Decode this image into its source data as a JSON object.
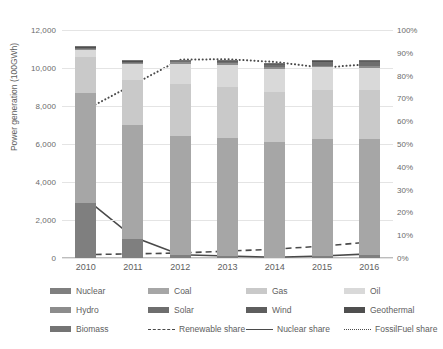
{
  "chart_data": {
    "type": "bar",
    "title": "",
    "subtitle": "",
    "xlabel": "",
    "ylabel": "Power generation (100GWh)",
    "y2label": "",
    "categories": [
      "2010",
      "2011",
      "2012",
      "2013",
      "2014",
      "2015",
      "2016"
    ],
    "ylim": [
      0,
      12000
    ],
    "y2lim": [
      0,
      100
    ],
    "yticks": [
      "0",
      "2,000",
      "4,000",
      "6,000",
      "8,000",
      "10,000",
      "12,000"
    ],
    "ytick_values": [
      0,
      2000,
      4000,
      6000,
      8000,
      10000,
      12000
    ],
    "y2ticks": [
      "0%",
      "10%",
      "20%",
      "30%",
      "40%",
      "50%",
      "60%",
      "70%",
      "80%",
      "90%",
      "100%"
    ],
    "y2tick_values": [
      0,
      10,
      20,
      30,
      40,
      50,
      60,
      70,
      80,
      90,
      100
    ],
    "grid": true,
    "legend_position": "bottom",
    "stacked": true,
    "series": [
      {
        "name": "Nuclear",
        "axis": "left",
        "kind": "bar",
        "color": "#7f7f7f",
        "values": [
          2882,
          1018,
          159,
          93,
          0,
          94,
          181
        ]
      },
      {
        "name": "Coal",
        "axis": "left",
        "kind": "bar",
        "color": "#a6a6a6",
        "values": [
          5800,
          5987,
          6240,
          6206,
          6100,
          6144,
          6094
        ]
      },
      {
        "name": "Gas",
        "axis": "left",
        "kind": "bar",
        "color": "#c9c9c9",
        "values": [
          1880,
          2386,
          2770,
          2700,
          2660,
          2620,
          2580
        ]
      },
      {
        "name": "Oil",
        "axis": "left",
        "kind": "bar",
        "color": "#d9d9d9",
        "values": [
          410,
          820,
          1060,
          1180,
          1200,
          1180,
          1140
        ]
      },
      {
        "name": "Hydro",
        "axis": "left",
        "kind": "bar",
        "color": "#8c8c8c",
        "values": [
          85,
          90,
          92,
          88,
          90,
          92,
          95
        ]
      },
      {
        "name": "Solar",
        "axis": "left",
        "kind": "bar",
        "color": "#6e6e6e",
        "values": [
          5,
          12,
          30,
          70,
          120,
          180,
          240
        ]
      },
      {
        "name": "Wind",
        "axis": "left",
        "kind": "bar",
        "color": "#5e5e5e",
        "values": [
          40,
          45,
          48,
          52,
          56,
          60,
          64
        ]
      },
      {
        "name": "Geothermal",
        "axis": "left",
        "kind": "bar",
        "color": "#4f4f4f",
        "values": [
          26,
          27,
          26,
          26,
          26,
          26,
          26
        ]
      },
      {
        "name": "Biomass",
        "axis": "left",
        "kind": "bar",
        "color": "#747474",
        "values": [
          12,
          15,
          18,
          20,
          22,
          24,
          26
        ]
      },
      {
        "name": "Renewable share",
        "axis": "right",
        "kind": "line",
        "style": "dashed",
        "color": "#4a4a4a",
        "values": [
          1.5,
          1.8,
          2.2,
          3.0,
          3.9,
          5.2,
          7.0
        ]
      },
      {
        "name": "Nuclear share",
        "axis": "right",
        "kind": "line",
        "style": "solid",
        "color": "#4a4a4a",
        "values": [
          26.0,
          9.3,
          1.4,
          0.9,
          0.3,
          0.9,
          1.8
        ]
      },
      {
        "name": "FossilFuel share",
        "axis": "right",
        "kind": "line",
        "style": "dotted",
        "color": "#4a4a4a",
        "values": [
          65.0,
          76.0,
          87.0,
          87.2,
          86.0,
          83.5,
          85.0
        ]
      }
    ],
    "bar_totals": [
      11140,
      10400,
      10443,
      10435,
      10274,
      10420,
      10446
    ],
    "legend_entries": [
      {
        "label": "Nuclear",
        "type": "swatch",
        "color": "#7f7f7f"
      },
      {
        "label": "Coal",
        "type": "swatch",
        "color": "#a6a6a6"
      },
      {
        "label": "Gas",
        "type": "swatch",
        "color": "#c9c9c9"
      },
      {
        "label": "Oil",
        "type": "swatch",
        "color": "#d9d9d9"
      },
      {
        "label": "Hydro",
        "type": "swatch",
        "color": "#8c8c8c"
      },
      {
        "label": "Solar",
        "type": "swatch",
        "color": "#6e6e6e"
      },
      {
        "label": "Wind",
        "type": "swatch",
        "color": "#5e5e5e"
      },
      {
        "label": "Geothermal",
        "type": "swatch",
        "color": "#4f4f4f"
      },
      {
        "label": "Biomass",
        "type": "swatch",
        "color": "#747474"
      },
      {
        "label": "Renewable share",
        "type": "dashed",
        "color": "#4a4a4a"
      },
      {
        "label": "Nuclear share",
        "type": "solid",
        "color": "#4a4a4a"
      },
      {
        "label": "FossilFuel share",
        "type": "dotted",
        "color": "#4a4a4a"
      }
    ]
  },
  "colors": {
    "background": "#ffffff",
    "grid": "#e4e4e4",
    "axis": "#bdbdbd",
    "text": "#5e5e5e"
  }
}
